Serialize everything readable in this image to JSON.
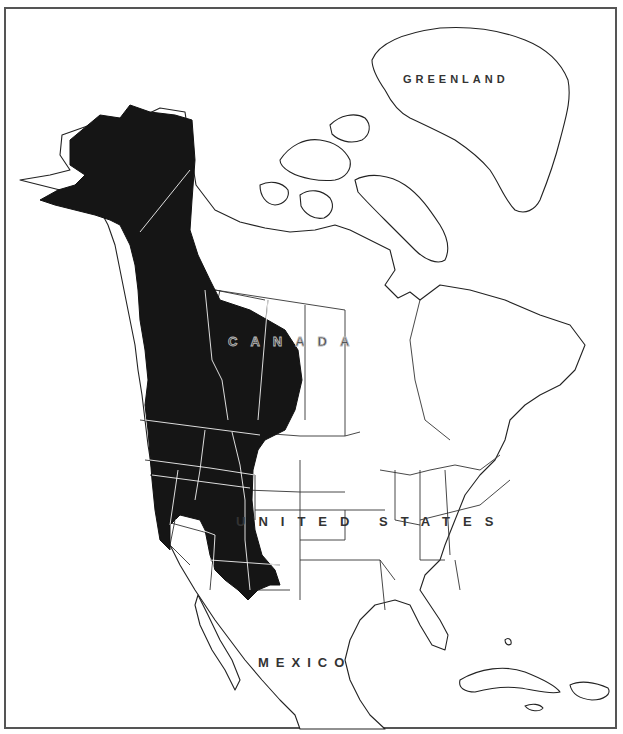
{
  "map": {
    "type": "range map",
    "region": "North America",
    "labels": {
      "greenland": "GREENLAND",
      "canada": "CANADA",
      "united_states": "UNITED STATES",
      "mexico": "MEXICO"
    },
    "colors": {
      "range_fill": "#151515",
      "land_fill": "#ffffff",
      "outline": "#222222",
      "frame": "#555555"
    },
    "range_description": "Shaded range covers Alaska, Yukon, British Columbia, western Alberta/Saskatchewan, and the western US interior (WA, OR, ID, MT, WY, NV, UT, CO, AZ, NM)"
  }
}
